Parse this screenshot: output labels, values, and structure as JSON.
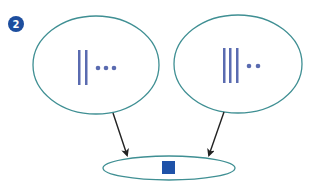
{
  "badge": {
    "label": "2",
    "color": "#1d4e9e"
  },
  "colors": {
    "ellipse_stroke": "#3f8f93",
    "tally": "#5a6bb0",
    "arrow": "#222222",
    "result_square": "#1f52a8"
  },
  "diagram": {
    "left_set": {
      "tally_bars": 2,
      "dots": 3
    },
    "right_set": {
      "tally_bars": 3,
      "dots": 2
    },
    "result_set": {
      "items": [
        "square"
      ]
    }
  }
}
